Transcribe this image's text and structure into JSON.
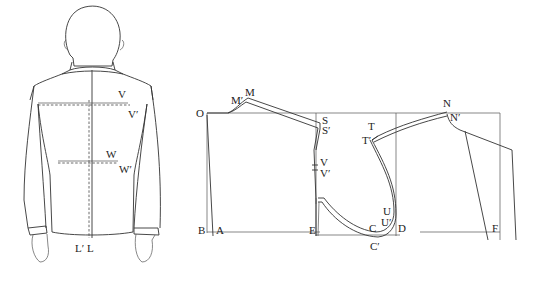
{
  "figure_left": {
    "description": "back view of jacket on figure",
    "labels": {
      "V": "V",
      "V_prime": "V′",
      "W": "W",
      "W_prime": "W′",
      "L_prime": "L′",
      "L": "L"
    }
  },
  "figure_right": {
    "description": "back pattern draft",
    "labels": {
      "O": "O",
      "M_prime": "M′",
      "M": "M",
      "S": "S",
      "S_prime": "S′",
      "V": "V",
      "V_prime": "V′",
      "T": "T",
      "T_prime": "T′",
      "N": "N",
      "N_prime": "N′",
      "B": "B",
      "A": "A",
      "E": "E",
      "C": "C",
      "C_prime": "C′",
      "U": "U",
      "U_prime": "U′",
      "D": "D",
      "F": "F"
    }
  }
}
